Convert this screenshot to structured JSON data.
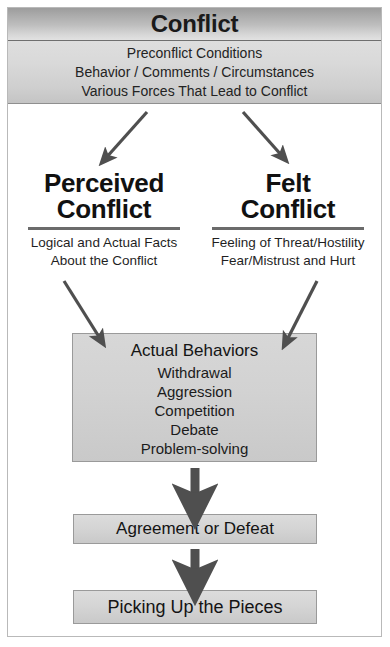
{
  "diagram": {
    "title": "Conflict",
    "header": {
      "lines": [
        "Preconflict Conditions",
        "Behavior / Comments / Circumstances",
        "Various Forces That Lead to Conflict"
      ]
    },
    "branches": [
      {
        "heading_line1": "Perceived",
        "heading_line2": "Conflict",
        "desc_line1": "Logical and Actual Facts",
        "desc_line2": "About the Conflict"
      },
      {
        "heading_line1": "Felt",
        "heading_line2": "Conflict",
        "desc_line1": "Feeling of Threat/Hostility",
        "desc_line2": "Fear/Mistrust and Hurt"
      }
    ],
    "behaviors": {
      "heading": "Actual Behaviors",
      "items": [
        "Withdrawal",
        "Aggression",
        "Competition",
        "Debate",
        "Problem-solving"
      ]
    },
    "outcomes": [
      {
        "label": "Agreement or Defeat"
      },
      {
        "label": "Picking Up the Pieces"
      }
    ],
    "colors": {
      "title_band_dark": "#9c9c9c",
      "title_band_light": "#e2e2e2",
      "sub_band": "#d9d9d9",
      "box_fill": "#d2d2d2",
      "box_border": "#9a9a9a",
      "arrow": "#4f4f4f",
      "text": "#1a1a1a",
      "frame": "#b9b9b9"
    }
  }
}
